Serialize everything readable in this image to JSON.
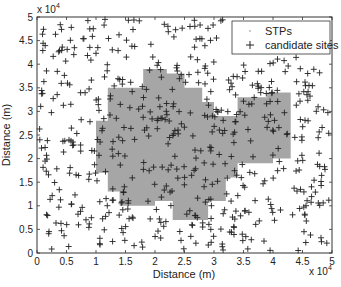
{
  "chart_data": {
    "type": "scatter",
    "title": "",
    "xlabel": "Distance (m)",
    "ylabel": "Distance (m)",
    "x_multiplier": "x 10^4",
    "y_multiplier": "x 10^4",
    "xlim": [
      0,
      50000
    ],
    "ylim": [
      0,
      50000
    ],
    "xticks": [
      "0",
      "0.5",
      "1",
      "1.5",
      "2",
      "2.5",
      "3",
      "3.5",
      "4",
      "4.5",
      "5"
    ],
    "yticks": [
      "0",
      "0.5",
      "1",
      "1.5",
      "2",
      "2.5",
      "3",
      "3.5",
      "4",
      "4.5",
      "5"
    ],
    "grid": false,
    "legend_position": "upper right",
    "series": [
      {
        "name": "STPs",
        "marker": ".",
        "color": "#999999",
        "description": "dense gray region in the center (approx x 0.9e4-4.3e4, y 0.7e4-4.0e4)"
      },
      {
        "name": "candidate sites",
        "marker": "+",
        "color": "#222222",
        "count_approx": 600
      }
    ],
    "stp_region_polygon": [
      [
        1.2,
        3.5
      ],
      [
        1.8,
        3.5
      ],
      [
        1.8,
        3.9
      ],
      [
        2.2,
        3.9
      ],
      [
        2.2,
        3.8
      ],
      [
        2.5,
        3.8
      ],
      [
        2.5,
        3.5
      ],
      [
        2.8,
        3.5
      ],
      [
        2.8,
        3.2
      ],
      [
        3.0,
        3.2
      ],
      [
        3.0,
        2.9
      ],
      [
        3.4,
        2.9
      ],
      [
        3.4,
        3.3
      ],
      [
        3.9,
        3.3
      ],
      [
        3.9,
        3.4
      ],
      [
        4.3,
        3.4
      ],
      [
        4.3,
        2.0
      ],
      [
        4.0,
        2.0
      ],
      [
        4.0,
        1.9
      ],
      [
        3.4,
        1.9
      ],
      [
        3.4,
        1.6
      ],
      [
        3.2,
        1.6
      ],
      [
        3.2,
        1.1
      ],
      [
        2.9,
        1.1
      ],
      [
        2.9,
        0.7
      ],
      [
        2.3,
        0.7
      ],
      [
        2.3,
        1.1
      ],
      [
        2.0,
        1.1
      ],
      [
        2.0,
        1.0
      ],
      [
        1.4,
        1.0
      ],
      [
        1.4,
        1.3
      ],
      [
        1.2,
        1.3
      ],
      [
        1.2,
        1.7
      ],
      [
        1.0,
        1.7
      ],
      [
        1.0,
        2.8
      ],
      [
        1.2,
        2.8
      ]
    ]
  },
  "axes": {
    "xlabel": "Distance (m)",
    "ylabel": "Distance (m)",
    "x_exp_base": "x 10",
    "x_exp_power": "4",
    "y_exp_base": "x 10",
    "y_exp_power": "4"
  },
  "legend": {
    "items": [
      {
        "label": "STPs"
      },
      {
        "label": "candidate sites"
      }
    ]
  }
}
